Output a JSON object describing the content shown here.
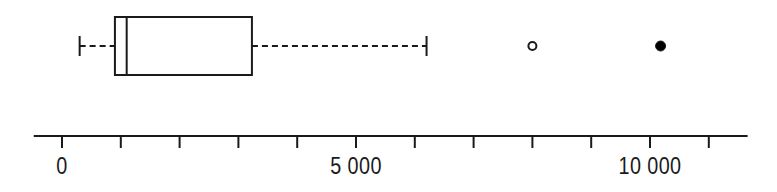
{
  "chart_data": {
    "type": "boxplot",
    "title": "",
    "xlabel": "",
    "ylabel": "",
    "orientation": "horizontal",
    "grid": false,
    "legend": false,
    "xlim": [
      -480,
      11660
    ],
    "axis": {
      "line_start_value": -480,
      "line_end_value": 11660,
      "tick_interval": 1000,
      "tick_values": [
        0,
        1000,
        2000,
        3000,
        4000,
        5000,
        6000,
        7000,
        8000,
        9000,
        10000,
        11000
      ],
      "labeled_ticks": [
        {
          "value": 0,
          "label": "0"
        },
        {
          "value": 5000,
          "label": "5 000"
        },
        {
          "value": 10000,
          "label": "10 000"
        }
      ]
    },
    "box": {
      "lower_whisker": 300,
      "q1": 900,
      "median": 1100,
      "q3": 3230,
      "upper_whisker": 6200
    },
    "outliers": [
      {
        "value": 8000,
        "style": "open-circle"
      },
      {
        "value": 10180,
        "style": "filled-circle"
      }
    ],
    "colors": {
      "line": "#1a1a1a",
      "background": "#ffffff",
      "marker_fill": "#000000",
      "marker_open_fill": "#ffffff"
    }
  }
}
